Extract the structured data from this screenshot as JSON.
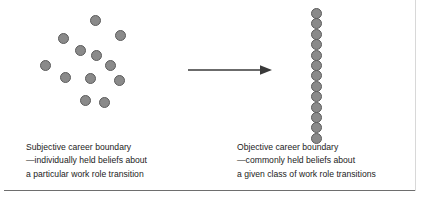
{
  "figure": {
    "background_color": "#ffffff",
    "width": 425,
    "height": 204
  },
  "style": {
    "dot_fill": "#8a8a8a",
    "dot_stroke": "#5c5c5c",
    "dot_diameter": 11,
    "arrow_color": "#3a3a3a",
    "text_color": "#1b1b1b",
    "rule_color": "#6e6e6e"
  },
  "left_group": {
    "name": "scattered-dots",
    "description": "Randomly scattered circles representing individually held beliefs",
    "dot_count": 12,
    "dots": [
      {
        "x": 95,
        "y": 20
      },
      {
        "x": 63,
        "y": 38
      },
      {
        "x": 120,
        "y": 35
      },
      {
        "x": 96,
        "y": 55
      },
      {
        "x": 80,
        "y": 50
      },
      {
        "x": 110,
        "y": 65
      },
      {
        "x": 45,
        "y": 65
      },
      {
        "x": 65,
        "y": 77
      },
      {
        "x": 90,
        "y": 78
      },
      {
        "x": 119,
        "y": 80
      },
      {
        "x": 85,
        "y": 100
      },
      {
        "x": 104,
        "y": 102
      }
    ]
  },
  "right_group": {
    "name": "vertical-line-of-dots",
    "description": "Circles aligned in a straight vertical column representing commonly held beliefs",
    "dot_count": 13,
    "column_x": 316,
    "start_y": 8,
    "spacing": 10.4
  },
  "arrow": {
    "name": "transition-arrow",
    "direction": "right",
    "start_x": 188,
    "end_x": 272,
    "y": 70
  },
  "captions": {
    "subjective": {
      "lines": [
        "Subjective career boundary",
        "—individually held beliefs about",
        "a particular work role transition"
      ]
    },
    "objective": {
      "lines": [
        "Objective career boundary",
        "—commonly held beliefs about",
        "a given class of work role transitions"
      ]
    }
  }
}
